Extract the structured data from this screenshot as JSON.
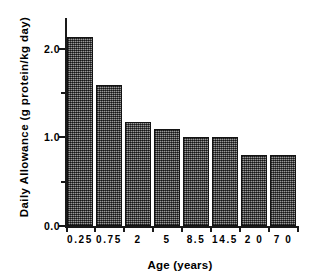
{
  "chart_data": {
    "type": "bar",
    "title": "",
    "xlabel": "Age (years)",
    "ylabel": "Daily  Allowance  (g  protein/kg day)",
    "categories": [
      "0.25",
      "0.75",
      "2",
      "5",
      "8.5",
      "14.5",
      "2 0",
      "7 0"
    ],
    "values": [
      2.14,
      1.59,
      1.18,
      1.1,
      1.0,
      1.0,
      0.8,
      0.8
    ],
    "ylim": [
      0.0,
      2.35
    ],
    "ytick_labels": [
      "0.0",
      "1.0",
      "2.0"
    ],
    "ytick_values": [
      0.0,
      1.0,
      2.0
    ],
    "yminor_ticks": [
      0.5,
      1.5
    ],
    "grid": false,
    "legend": null,
    "bar_color": "#6e6e6e",
    "bar_edge_color": "#141414",
    "axis_color": "#1a1a1a",
    "background": "#ffffff"
  }
}
